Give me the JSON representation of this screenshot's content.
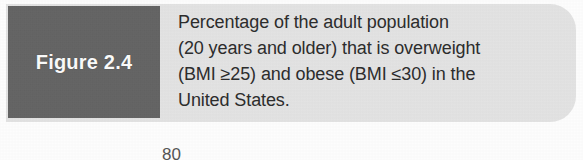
{
  "figure": {
    "number_label": "Figure 2.4",
    "tab_color": "#646464",
    "banner_color": "#e3e3e3",
    "text_color": "#2d2d2d",
    "label_color": "#fbfbfb"
  },
  "caption": {
    "full_text": "Percentage of the adult population (20 years and older) that is overweight (BMI ≥25) and obese (BMI ≤30) in the United States.",
    "lines": [
      "Percentage of the adult population",
      "(20 years and older) that is overweight",
      "(BMI ≥25) and obese (BMI ≤30) in the",
      "United States."
    ]
  },
  "chart_fragment": {
    "axis_tick_label": "80"
  }
}
